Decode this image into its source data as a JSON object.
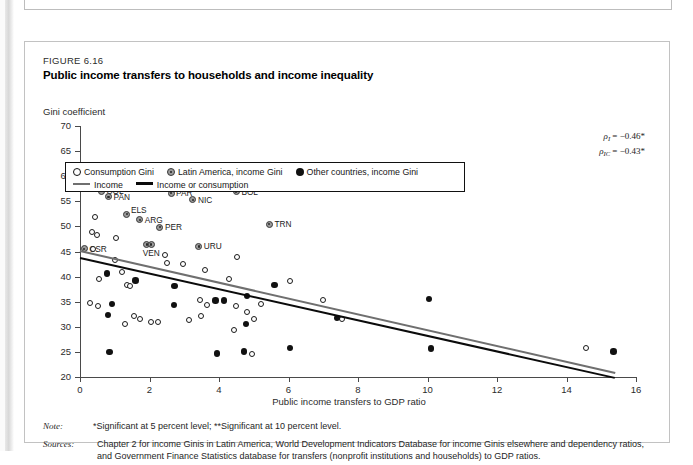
{
  "figure": {
    "number": "FIGURE 6.16",
    "title": "Public income transfers to households and income inequality",
    "y_axis_caption": "Gini coefficient"
  },
  "legend": {
    "consumption": "Consumption Gini",
    "latin_america": "Latin America, income Gini",
    "other": "Other countries, income Gini",
    "income_line": "Income",
    "income_or_consumption_line": "Income or consumption"
  },
  "stats": {
    "rho_i_label": "ρ",
    "rho_i_sub": "I",
    "rho_i_value": "= −0.46*",
    "rho_ic_label": "ρ",
    "rho_ic_sub": "IC",
    "rho_ic_value": "= −0.43*"
  },
  "notes": {
    "note_label": "Note:",
    "note_text": "*Significant at 5 percent level; **Significant at 10 percent level.",
    "sources_label": "Sources:",
    "sources_text": "Chapter 2 for income Ginis in Latin America, World Development Indicators Database for income Ginis elsewhere and dependency ratios, and Government Finance Statistics database for transfers (nonprofit institutions and households) to GDP ratios."
  },
  "chart_data": {
    "type": "scatter",
    "title": "Public income transfers to households and income inequality",
    "xlabel": "Public income transfers to GDP ratio",
    "ylabel": "Gini coefficient",
    "xlim": [
      0,
      16
    ],
    "ylim": [
      20,
      70
    ],
    "xticks": [
      0,
      2,
      4,
      6,
      8,
      10,
      12,
      14,
      16
    ],
    "yticks": [
      20,
      25,
      30,
      35,
      40,
      45,
      50,
      55,
      60,
      65,
      70
    ],
    "grid": false,
    "legend_position": "top-left inside",
    "series": [
      {
        "name": "Latin America, income Gini",
        "marker": "la",
        "points": [
          {
            "label": "GUA",
            "x": 1.55,
            "y": 59.2
          },
          {
            "label": "BRA",
            "x": 1.95,
            "y": 58.0
          },
          {
            "label": "COL",
            "x": 0.62,
            "y": 57.0
          },
          {
            "label": "PAN",
            "x": 0.82,
            "y": 55.9
          },
          {
            "label": "PAR",
            "x": 2.62,
            "y": 56.6
          },
          {
            "label": "NIC",
            "x": 3.25,
            "y": 55.3
          },
          {
            "label": "BOL",
            "x": 4.5,
            "y": 56.9
          },
          {
            "label": "ELS",
            "x": 1.35,
            "y": 52.4
          },
          {
            "label": "ARG",
            "x": 1.72,
            "y": 51.3
          },
          {
            "label": "PER",
            "x": 2.3,
            "y": 49.8
          },
          {
            "label": "TRN",
            "x": 5.45,
            "y": 50.4
          },
          {
            "label": "VEN",
            "x": 1.92,
            "y": 46.4
          },
          {
            "label": "VEN2",
            "x": 2.05,
            "y": 46.4
          },
          {
            "label": "CSR",
            "x": 0.12,
            "y": 45.5
          },
          {
            "label": "URU",
            "x": 3.42,
            "y": 46.0
          }
        ]
      },
      {
        "name": "Consumption Gini",
        "marker": "open",
        "points": [
          {
            "x": 2.55,
            "y": 62.0
          },
          {
            "x": 0.4,
            "y": 57.6
          },
          {
            "x": 0.42,
            "y": 51.9
          },
          {
            "x": 0.35,
            "y": 48.8
          },
          {
            "x": 0.48,
            "y": 48.2
          },
          {
            "x": 1.05,
            "y": 47.6
          },
          {
            "x": 0.38,
            "y": 45.5
          },
          {
            "x": 2.45,
            "y": 44.3
          },
          {
            "x": 4.52,
            "y": 43.9
          },
          {
            "x": 1.02,
            "y": 43.4
          },
          {
            "x": 2.5,
            "y": 42.7
          },
          {
            "x": 2.95,
            "y": 42.6
          },
          {
            "x": 1.2,
            "y": 41.0
          },
          {
            "x": 3.6,
            "y": 41.3
          },
          {
            "x": 0.55,
            "y": 39.6
          },
          {
            "x": 4.3,
            "y": 39.5
          },
          {
            "x": 6.05,
            "y": 39.1
          },
          {
            "x": 1.35,
            "y": 38.3
          },
          {
            "x": 1.45,
            "y": 38.2
          },
          {
            "x": 0.3,
            "y": 34.8
          },
          {
            "x": 0.52,
            "y": 34.2
          },
          {
            "x": 3.45,
            "y": 35.3
          },
          {
            "x": 3.65,
            "y": 34.3
          },
          {
            "x": 4.5,
            "y": 34.2
          },
          {
            "x": 5.2,
            "y": 34.5
          },
          {
            "x": 7.0,
            "y": 35.4
          },
          {
            "x": 1.55,
            "y": 32.1
          },
          {
            "x": 1.72,
            "y": 31.5
          },
          {
            "x": 3.15,
            "y": 31.4
          },
          {
            "x": 3.48,
            "y": 32.1
          },
          {
            "x": 1.3,
            "y": 30.6
          },
          {
            "x": 2.05,
            "y": 31.0
          },
          {
            "x": 2.25,
            "y": 30.9
          },
          {
            "x": 4.8,
            "y": 33.0
          },
          {
            "x": 5.0,
            "y": 31.5
          },
          {
            "x": 7.55,
            "y": 31.5
          },
          {
            "x": 4.42,
            "y": 29.4
          },
          {
            "x": 14.55,
            "y": 25.8
          },
          {
            "x": 4.95,
            "y": 24.5
          }
        ]
      },
      {
        "name": "Other countries, income Gini",
        "marker": "filled",
        "points": [
          {
            "x": 0.78,
            "y": 40.6
          },
          {
            "x": 1.6,
            "y": 39.2
          },
          {
            "x": 2.72,
            "y": 38.1
          },
          {
            "x": 5.6,
            "y": 38.3
          },
          {
            "x": 0.92,
            "y": 34.5
          },
          {
            "x": 2.7,
            "y": 34.4
          },
          {
            "x": 3.9,
            "y": 35.2
          },
          {
            "x": 4.15,
            "y": 35.2
          },
          {
            "x": 4.8,
            "y": 36.1
          },
          {
            "x": 10.05,
            "y": 35.5
          },
          {
            "x": 0.8,
            "y": 32.3
          },
          {
            "x": 7.4,
            "y": 31.8
          },
          {
            "x": 4.78,
            "y": 30.6
          },
          {
            "x": 0.85,
            "y": 25.0
          },
          {
            "x": 3.95,
            "y": 24.7
          },
          {
            "x": 4.72,
            "y": 25.1
          },
          {
            "x": 6.05,
            "y": 25.8
          },
          {
            "x": 10.1,
            "y": 25.7
          },
          {
            "x": 15.35,
            "y": 25.1
          }
        ]
      }
    ],
    "trendlines": [
      {
        "name": "Income or consumption",
        "style": "grey",
        "x0": 0.0,
        "y0": 45.2,
        "x1": 15.4,
        "y1": 20.9
      },
      {
        "name": "Income",
        "style": "black",
        "x0": 0.0,
        "y0": 44.0,
        "x1": 15.4,
        "y1": 20.1
      }
    ]
  }
}
